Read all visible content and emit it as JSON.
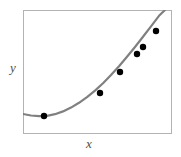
{
  "figure": {
    "frame": {
      "left": 23,
      "top": 10,
      "width": 149,
      "height": 124,
      "border_color": "#b3b3b3"
    },
    "curve_color": "#808080",
    "point_color": "#000000",
    "background": "#ffffff"
  },
  "labels": {
    "y_axis": "y",
    "x_axis": "x"
  },
  "chart_data": {
    "type": "line",
    "title": "",
    "xlabel": "x",
    "ylabel": "y",
    "grid": false,
    "legend": null,
    "axis_ticks": {
      "x": [],
      "y": []
    },
    "xlim": [
      0,
      1
    ],
    "ylim": [
      0,
      1
    ],
    "series": [
      {
        "name": "fitted curve",
        "style": "solid",
        "color": "#808080",
        "width": 2.2,
        "path_points": [
          [
            23,
            114
          ],
          [
            31,
            115.5
          ],
          [
            39,
            116.2
          ],
          [
            47,
            115.8
          ],
          [
            55,
            114.2
          ],
          [
            63,
            111.4
          ],
          [
            71,
            107.6
          ],
          [
            79,
            102.8
          ],
          [
            87,
            97.2
          ],
          [
            95,
            90.6
          ],
          [
            103,
            83.2
          ],
          [
            111,
            75.0
          ],
          [
            119,
            66.2
          ],
          [
            127,
            56.8
          ],
          [
            135,
            47.0
          ],
          [
            143,
            36.8
          ],
          [
            151,
            26.4
          ],
          [
            159,
            15.8
          ],
          [
            165,
            10.0
          ]
        ]
      },
      {
        "name": "data points",
        "style": "markers",
        "color": "#000000",
        "marker": "circle",
        "marker_size": 3.2,
        "points": [
          [
            44,
            116
          ],
          [
            100,
            93
          ],
          [
            120,
            72
          ],
          [
            137,
            54
          ],
          [
            143,
            47
          ],
          [
            156,
            31
          ]
        ]
      }
    ]
  }
}
